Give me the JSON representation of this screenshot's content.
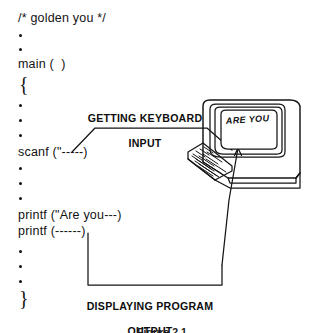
{
  "figure": {
    "caption": "Figure 2.1",
    "caption_visible": "partial"
  },
  "code": {
    "lines": [
      {
        "id": "comment",
        "text": "/* golden you */"
      },
      {
        "id": "main",
        "text": "main (  )"
      },
      {
        "id": "open-brace",
        "text": "{"
      },
      {
        "id": "scanf",
        "text": "scanf (\"-----)"
      },
      {
        "id": "printf1",
        "text": "printf (\"Are you---)"
      },
      {
        "id": "printf2",
        "text": "printf (------)"
      },
      {
        "id": "close-brace",
        "text": "}"
      }
    ],
    "ellipsis_label": "vertical ellipsis"
  },
  "callouts": [
    {
      "id": "input-callout",
      "line1": "GETTING KEYBOARD",
      "line2": "INPUT",
      "points_to": "keyboard",
      "points_from": "scanf"
    },
    {
      "id": "output-callout",
      "line1": "DISPLAYING PROGRAM",
      "line2": "OUTPUT",
      "points_to": "monitor-screen",
      "points_from": "printf"
    }
  ],
  "computer": {
    "label": "desktop-computer-illustration",
    "screen_text": "ARE YOU",
    "parts": [
      "monitor",
      "screen",
      "keyboard",
      "case"
    ]
  },
  "colors": {
    "ink": "#121212",
    "paper": "#ffffff",
    "stroke": "#141414"
  }
}
